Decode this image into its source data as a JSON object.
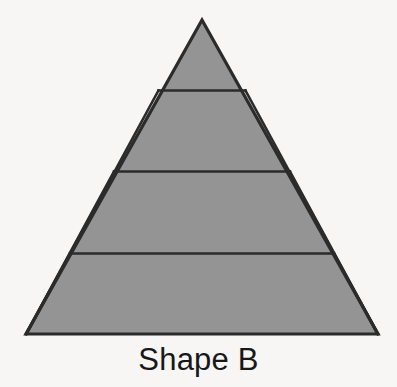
{
  "figure": {
    "caption": "Shape B",
    "colors": {
      "background": "#f7f6f4",
      "fill": "#949494",
      "stroke": "#2b2b2b",
      "caption_text": "#18181a"
    }
  },
  "chart_data": {
    "type": "diagram",
    "title": "Shape B",
    "shape": "equilateral-triangle",
    "subdivision": {
      "rows": 4,
      "total_small_triangles": 16,
      "upward_triangles": 10,
      "downward_triangles": 6,
      "row_counts": [
        1,
        3,
        5,
        7
      ]
    },
    "outer_vertices": {
      "apex": [
        202,
        20
      ],
      "bottom_left": [
        26,
        334
      ],
      "bottom_right": [
        378,
        334
      ]
    },
    "grid_rows": [
      {
        "row": 1,
        "y_top": 20,
        "y_bottom": 90.5,
        "x_left": 158.5,
        "x_right": 245.5,
        "up": 1,
        "down": 0
      },
      {
        "row": 2,
        "y_top": 90.5,
        "y_bottom": 171.5,
        "x_left": 114,
        "x_right": 290,
        "up": 2,
        "down": 1
      },
      {
        "row": 3,
        "y_top": 171.5,
        "y_bottom": 253.5,
        "x_left": 70,
        "x_right": 334,
        "up": 3,
        "down": 2
      },
      {
        "row": 4,
        "y_top": 253.5,
        "y_bottom": 334,
        "x_left": 26,
        "x_right": 378,
        "up": 4,
        "down": 3
      }
    ],
    "axis_labels": {
      "x": "",
      "y": ""
    },
    "grid": false,
    "legend": null
  }
}
